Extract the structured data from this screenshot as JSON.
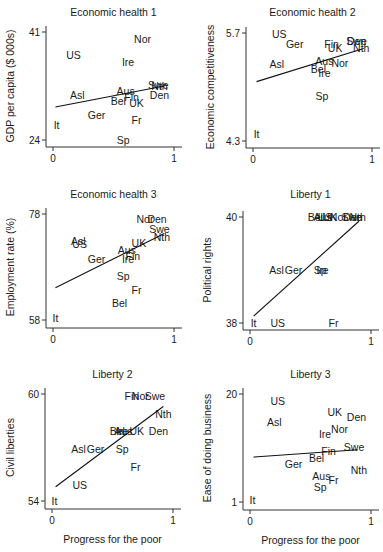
{
  "figure": {
    "shared_xlabel": "Progress for the poor"
  },
  "chart_data": [
    {
      "type": "scatter",
      "title": "Economic health 1",
      "xlabel": "",
      "ylabel": "GDP per capita ($ 000s)",
      "xlim": [
        0,
        1
      ],
      "ylim": [
        24,
        41
      ],
      "xticks": [
        "0",
        "1"
      ],
      "yticks": [
        "24",
        "41"
      ],
      "frame": {
        "axis_x": 46,
        "x0": 53,
        "x1": 174,
        "x_end": 182,
        "y_top": 32,
        "y_bot": 140,
        "axis_y": 147,
        "title_y": 16,
        "ylabel_x": 14
      },
      "fit_line": [
        [
          0.02,
          29.2
        ],
        [
          0.92,
          32.5
        ]
      ],
      "points": [
        {
          "label": "US",
          "x": 0.17,
          "y": 37.4
        },
        {
          "label": "Nor",
          "x": 0.74,
          "y": 39.9
        },
        {
          "label": "Ire",
          "x": 0.62,
          "y": 36.3
        },
        {
          "label": "Asl",
          "x": 0.2,
          "y": 31.1
        },
        {
          "label": "Aus",
          "x": 0.6,
          "y": 31.7
        },
        {
          "label": "Fin",
          "x": 0.65,
          "y": 30.8
        },
        {
          "label": "Bel",
          "x": 0.54,
          "y": 30.1
        },
        {
          "label": "UK",
          "x": 0.69,
          "y": 29.9
        },
        {
          "label": "Swe",
          "x": 0.87,
          "y": 32.6
        },
        {
          "label": "Nth",
          "x": 0.88,
          "y": 32.5
        },
        {
          "label": "Den",
          "x": 0.88,
          "y": 31.1
        },
        {
          "label": "Ger",
          "x": 0.36,
          "y": 27.9
        },
        {
          "label": "Fr",
          "x": 0.69,
          "y": 27.1
        },
        {
          "label": "It",
          "x": 0.03,
          "y": 26.4
        },
        {
          "label": "Sp",
          "x": 0.58,
          "y": 24.0
        }
      ]
    },
    {
      "type": "scatter",
      "title": "Economic health 2",
      "xlabel": "",
      "ylabel": "Economic competitiveness",
      "xlim": [
        0,
        1
      ],
      "ylim": [
        4.3,
        5.7
      ],
      "xticks": [
        "0",
        "1"
      ],
      "yticks": [
        "4.3",
        "5.7"
      ],
      "frame": {
        "axis_x": 246,
        "x0": 253,
        "x1": 372,
        "x_end": 380,
        "y_top": 33,
        "y_bot": 141,
        "axis_y": 148,
        "title_y": 16,
        "ylabel_x": 214
      },
      "fit_line": [
        [
          0.03,
          5.07
        ],
        [
          0.93,
          5.5
        ]
      ],
      "points": [
        {
          "label": "US",
          "x": 0.22,
          "y": 5.69
        },
        {
          "label": "Ger",
          "x": 0.35,
          "y": 5.56
        },
        {
          "label": "Fin",
          "x": 0.66,
          "y": 5.56
        },
        {
          "label": "UK",
          "x": 0.69,
          "y": 5.5
        },
        {
          "label": "Swe",
          "x": 0.87,
          "y": 5.6
        },
        {
          "label": "Den",
          "x": 0.87,
          "y": 5.6
        },
        {
          "label": "Nth",
          "x": 0.91,
          "y": 5.5
        },
        {
          "label": "Aus",
          "x": 0.6,
          "y": 5.34
        },
        {
          "label": "Nor",
          "x": 0.73,
          "y": 5.31
        },
        {
          "label": "Asl",
          "x": 0.2,
          "y": 5.3
        },
        {
          "label": "Bel",
          "x": 0.55,
          "y": 5.23
        },
        {
          "label": "Ire",
          "x": 0.6,
          "y": 5.18
        },
        {
          "label": "Sp",
          "x": 0.58,
          "y": 4.88
        },
        {
          "label": "It",
          "x": 0.03,
          "y": 4.39
        }
      ]
    },
    {
      "type": "scatter",
      "title": "Economic health 3",
      "xlabel": "",
      "ylabel": "Employment rate (%)",
      "xlim": [
        0,
        1
      ],
      "ylim": [
        58,
        78
      ],
      "xticks": [
        "0",
        "1"
      ],
      "yticks": [
        "58",
        "78"
      ],
      "frame": {
        "axis_x": 46,
        "x0": 53,
        "x1": 174,
        "x_end": 182,
        "y_top": 214,
        "y_bot": 320,
        "axis_y": 328,
        "title_y": 198,
        "ylabel_x": 14
      },
      "fit_line": [
        [
          0.02,
          64.1
        ],
        [
          0.92,
          74.3
        ]
      ],
      "points": [
        {
          "label": "Nor",
          "x": 0.76,
          "y": 77.0
        },
        {
          "label": "Den",
          "x": 0.86,
          "y": 77.0
        },
        {
          "label": "Swe",
          "x": 0.88,
          "y": 75.2
        },
        {
          "label": "Nth",
          "x": 0.9,
          "y": 73.6
        },
        {
          "label": "Asl",
          "x": 0.21,
          "y": 73.0
        },
        {
          "label": "US",
          "x": 0.22,
          "y": 72.3
        },
        {
          "label": "UK",
          "x": 0.71,
          "y": 72.5
        },
        {
          "label": "Aus",
          "x": 0.61,
          "y": 71.3
        },
        {
          "label": "Fin",
          "x": 0.66,
          "y": 70.1
        },
        {
          "label": "Ger",
          "x": 0.36,
          "y": 69.6
        },
        {
          "label": "Ire",
          "x": 0.62,
          "y": 69.6
        },
        {
          "label": "Sp",
          "x": 0.58,
          "y": 66.3
        },
        {
          "label": "Fr",
          "x": 0.69,
          "y": 63.6
        },
        {
          "label": "Bel",
          "x": 0.55,
          "y": 61.3
        },
        {
          "label": "It",
          "x": 0.02,
          "y": 58.3
        }
      ]
    },
    {
      "type": "scatter",
      "title": "Liberty 1",
      "xlabel": "",
      "ylabel": "Political rights",
      "xlim": [
        0,
        1
      ],
      "ylim": [
        38,
        40
      ],
      "xticks": [
        "0",
        "1"
      ],
      "yticks": [
        "38",
        "40"
      ],
      "frame": {
        "axis_x": 243,
        "x0": 250,
        "x1": 371,
        "x_end": 379,
        "y_top": 217,
        "y_bot": 323,
        "axis_y": 330,
        "title_y": 198,
        "ylabel_x": 211
      },
      "fit_line": [
        [
          0.03,
          38.13
        ],
        [
          0.9,
          39.92
        ]
      ],
      "points": [
        {
          "label": "Bel",
          "x": 0.54,
          "y": 40
        },
        {
          "label": "Aus",
          "x": 0.6,
          "y": 40
        },
        {
          "label": "US",
          "x": 0.62,
          "y": 40
        },
        {
          "label": "UK",
          "x": 0.66,
          "y": 40
        },
        {
          "label": "Nor",
          "x": 0.73,
          "y": 40
        },
        {
          "label": "Swe",
          "x": 0.84,
          "y": 40
        },
        {
          "label": "Den",
          "x": 0.85,
          "y": 40
        },
        {
          "label": "Nth",
          "x": 0.89,
          "y": 40
        },
        {
          "label": "Asl",
          "x": 0.22,
          "y": 39
        },
        {
          "label": "Ger",
          "x": 0.36,
          "y": 39
        },
        {
          "label": "Sp",
          "x": 0.58,
          "y": 39
        },
        {
          "label": "Ire",
          "x": 0.6,
          "y": 39
        },
        {
          "label": "It",
          "x": 0.03,
          "y": 38
        },
        {
          "label": "US",
          "x": 0.23,
          "y": 38
        },
        {
          "label": "Fr",
          "x": 0.69,
          "y": 38
        }
      ]
    },
    {
      "type": "scatter",
      "title": "Liberty 2",
      "xlabel": "Progress for the poor",
      "ylabel": "Civil liberties",
      "xlim": [
        0,
        1
      ],
      "ylim": [
        54,
        60
      ],
      "xticks": [
        "0",
        "1"
      ],
      "yticks": [
        "54",
        "60"
      ],
      "frame": {
        "axis_x": 45,
        "x0": 52,
        "x1": 173,
        "x_end": 181,
        "y_top": 394,
        "y_bot": 501,
        "axis_y": 509,
        "title_y": 378,
        "ylabel_x": 14
      },
      "fit_line": [
        [
          0.03,
          54.8
        ],
        [
          0.92,
          59.3
        ]
      ],
      "points": [
        {
          "label": "Fin",
          "x": 0.66,
          "y": 59.9
        },
        {
          "label": "Nor",
          "x": 0.73,
          "y": 59.9
        },
        {
          "label": "Swe",
          "x": 0.85,
          "y": 59.9
        },
        {
          "label": "Nth",
          "x": 0.92,
          "y": 58.9
        },
        {
          "label": "Bel",
          "x": 0.54,
          "y": 57.9
        },
        {
          "label": "Aus",
          "x": 0.59,
          "y": 57.9
        },
        {
          "label": "Ire",
          "x": 0.58,
          "y": 57.9
        },
        {
          "label": "UK",
          "x": 0.7,
          "y": 57.9
        },
        {
          "label": "Den",
          "x": 0.88,
          "y": 57.9
        },
        {
          "label": "Asl",
          "x": 0.22,
          "y": 56.9
        },
        {
          "label": "Ger",
          "x": 0.36,
          "y": 56.9
        },
        {
          "label": "Sp",
          "x": 0.58,
          "y": 56.9
        },
        {
          "label": "Fr",
          "x": 0.69,
          "y": 55.9
        },
        {
          "label": "US",
          "x": 0.23,
          "y": 54.9
        },
        {
          "label": "It",
          "x": 0.02,
          "y": 54.0
        }
      ]
    },
    {
      "type": "scatter",
      "title": "Liberty 3",
      "xlabel": "Progress for the poor",
      "ylabel": "Ease of doing business",
      "xlim": [
        0,
        1
      ],
      "ylim": [
        20,
        1
      ],
      "y_inverted": true,
      "xticks": [
        "0",
        "1"
      ],
      "yticks": [
        "1",
        "20"
      ],
      "frame": {
        "axis_x": 243,
        "x0": 250,
        "x1": 371,
        "x_end": 379,
        "y_top": 394,
        "y_bot": 502,
        "axis_y": 510,
        "title_y": 378,
        "ylabel_x": 211
      },
      "fit_line": [
        [
          0.03,
          12.1
        ],
        [
          0.89,
          10.8
        ]
      ],
      "points": [
        {
          "label": "US",
          "x": 0.23,
          "y": 2.2
        },
        {
          "label": "UK",
          "x": 0.7,
          "y": 4.2
        },
        {
          "label": "Den",
          "x": 0.88,
          "y": 5.1
        },
        {
          "label": "Asl",
          "x": 0.2,
          "y": 6.0
        },
        {
          "label": "Nor",
          "x": 0.74,
          "y": 7.2
        },
        {
          "label": "Ire",
          "x": 0.62,
          "y": 8.0
        },
        {
          "label": "Swe",
          "x": 0.86,
          "y": 10.4
        },
        {
          "label": "Fin",
          "x": 0.65,
          "y": 11.0
        },
        {
          "label": "Bel",
          "x": 0.55,
          "y": 12.3
        },
        {
          "label": "Ger",
          "x": 0.36,
          "y": 13.4
        },
        {
          "label": "Nth",
          "x": 0.9,
          "y": 14.3
        },
        {
          "label": "Aus",
          "x": 0.59,
          "y": 15.5
        },
        {
          "label": "Fr",
          "x": 0.69,
          "y": 16.2
        },
        {
          "label": "Sp",
          "x": 0.58,
          "y": 17.3
        },
        {
          "label": "It",
          "x": 0.02,
          "y": 19.6
        }
      ]
    }
  ]
}
